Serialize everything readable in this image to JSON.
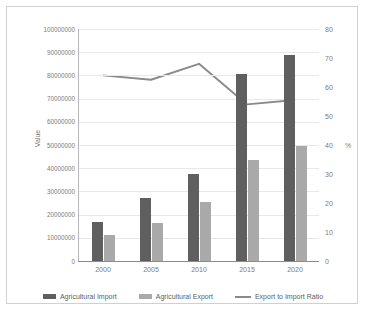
{
  "chart_data": {
    "type": "bar",
    "title": "",
    "subtitle": "",
    "categories": [
      "2000",
      "2005",
      "2010",
      "2015",
      "2020"
    ],
    "series": [
      {
        "name": "Agricultural Import",
        "type": "bar",
        "axis": "left",
        "color": "#5f5f5f",
        "values": [
          17000000,
          27000000,
          37500000,
          80500000,
          89000000
        ]
      },
      {
        "name": "Agricultural Export",
        "type": "bar",
        "axis": "left",
        "color": "#a9a9a9",
        "values": [
          11000000,
          16500000,
          25500000,
          43500000,
          49500000
        ]
      },
      {
        "name": "Export to Import Ratio",
        "type": "line",
        "axis": "right",
        "color": "#8a8a8a",
        "values": [
          64,
          62.5,
          68,
          54,
          55.5
        ]
      }
    ],
    "xlabel": "",
    "ylabel": "Value",
    "y2label": "%",
    "ylim": [
      0,
      100000000
    ],
    "y2lim": [
      0,
      80
    ],
    "yticks": [
      "0",
      "10000000",
      "20000000",
      "30000000",
      "40000000",
      "50000000",
      "60000000",
      "70000000",
      "80000000",
      "90000000",
      "100000000"
    ],
    "y2ticks": [
      "0",
      "10",
      "20",
      "30",
      "40",
      "50",
      "60",
      "70",
      "80"
    ],
    "grid": true,
    "legend_position": "bottom"
  },
  "legend": {
    "items": [
      {
        "label": "Agricultural Import",
        "marker": "bar",
        "color": "#5f5f5f"
      },
      {
        "label": "Agricultural Export",
        "marker": "bar",
        "color": "#a9a9a9"
      },
      {
        "label": "Export to Import Ratio",
        "marker": "line",
        "color": "#8a8a8a"
      }
    ]
  }
}
